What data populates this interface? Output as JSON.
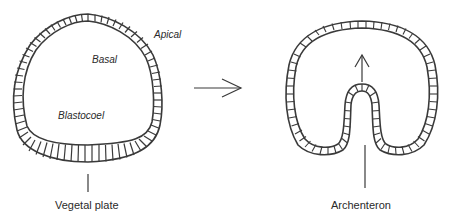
{
  "diagram": {
    "stage_left": {
      "name": "blastula",
      "labels": {
        "apical": "Apical",
        "basal": "Basal",
        "blastocoel": "Blastocoel",
        "vegetal_plate": "Vegetal plate"
      }
    },
    "transition_arrow": "right-arrow",
    "stage_right": {
      "name": "gastrula",
      "labels": {
        "archenteron": "Archenteron"
      },
      "arrow": "up-arrow"
    },
    "colors": {
      "line": "#3a3a3a",
      "text": "#2a2a2a",
      "background": "#ffffff"
    }
  }
}
